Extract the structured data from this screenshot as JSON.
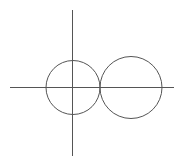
{
  "canvas": {
    "width": 195,
    "height": 165,
    "background": "#ffffff"
  },
  "colors": {
    "stroke": "#555555"
  },
  "axes": {
    "x_axis": {
      "x1": 10,
      "y1": 87.5,
      "x2": 174,
      "y2": 87.5
    },
    "y_axis": {
      "x1": 72.5,
      "y1": 10,
      "x2": 72.5,
      "y2": 156
    }
  },
  "circles": [
    {
      "name": "left-circle",
      "cx": 73,
      "cy": 87.5,
      "r": 27
    },
    {
      "name": "right-circle",
      "cx": 131,
      "cy": 87.5,
      "r": 31
    }
  ],
  "tangent_point": {
    "x": 100,
    "y": 87.5
  }
}
